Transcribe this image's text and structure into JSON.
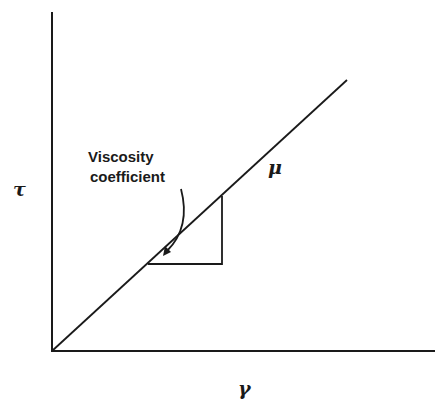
{
  "diagram": {
    "type": "shear-stress-vs-shear-rate",
    "y_axis_label": "τ",
    "x_axis_label": "γ",
    "line_label": "μ",
    "annotation": {
      "line1": "Viscosity",
      "line2": "coefficient"
    },
    "colors": {
      "ink": "#1a1a1a",
      "background": "#ffffff"
    }
  }
}
